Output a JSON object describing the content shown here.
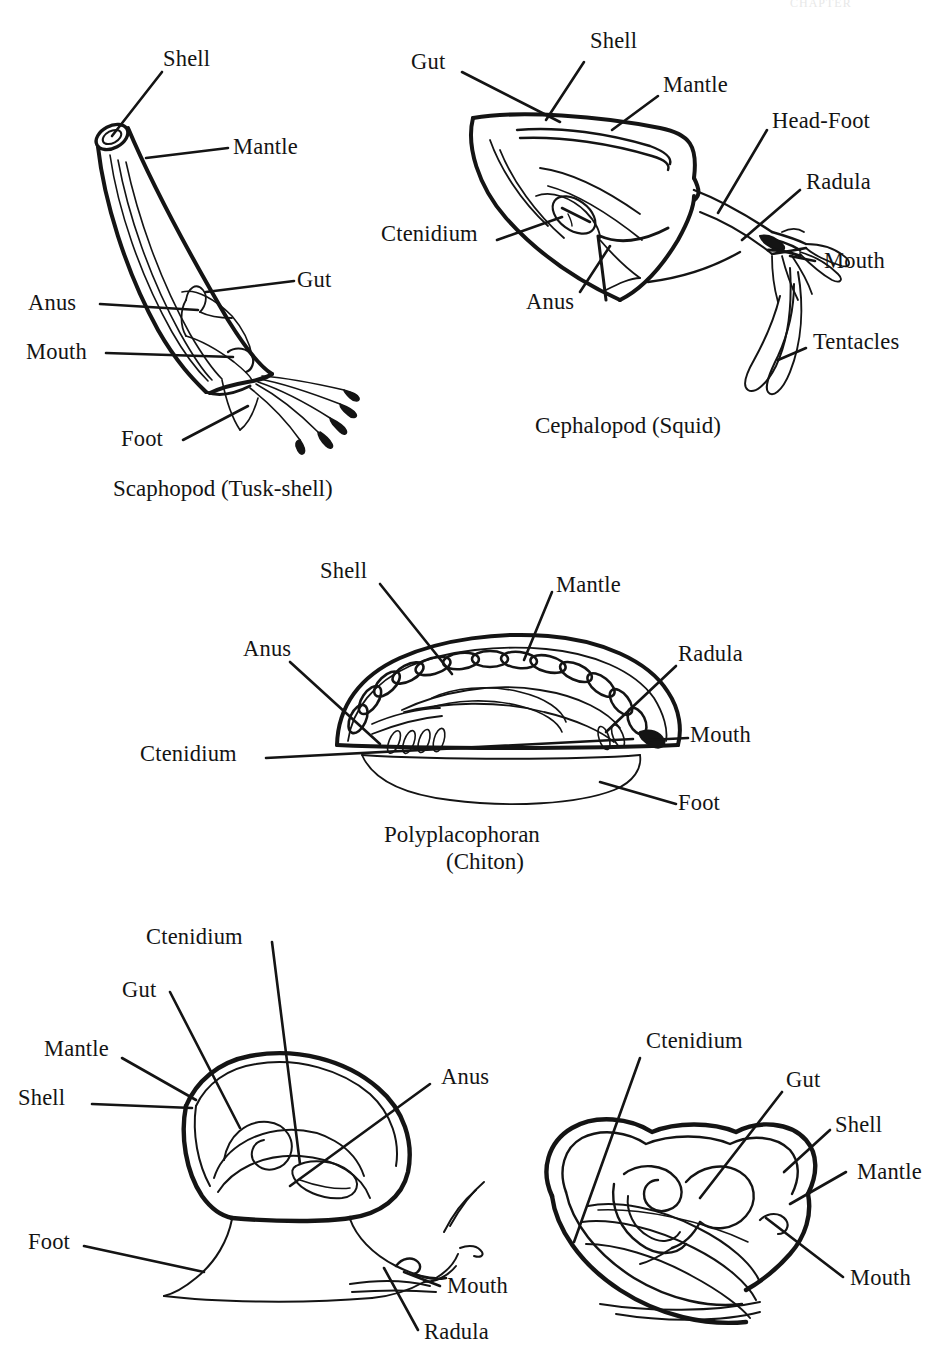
{
  "page": {
    "background_color": "#ffffff",
    "ink_color": "#141414",
    "header_fragment": "CHAPTER"
  },
  "panels": [
    {
      "key": "scaphopod",
      "caption": "Scaphopod (Tusk-shell)",
      "labels": [
        {
          "name": "shell",
          "text": "Shell"
        },
        {
          "name": "mantle",
          "text": "Mantle"
        },
        {
          "name": "gut",
          "text": "Gut"
        },
        {
          "name": "anus",
          "text": "Anus"
        },
        {
          "name": "mouth",
          "text": "Mouth"
        },
        {
          "name": "foot",
          "text": "Foot"
        }
      ]
    },
    {
      "key": "cephalopod",
      "caption": "Cephalopod (Squid)",
      "labels": [
        {
          "name": "gut",
          "text": "Gut"
        },
        {
          "name": "shell",
          "text": "Shell"
        },
        {
          "name": "mantle",
          "text": "Mantle"
        },
        {
          "name": "head-foot",
          "text": "Head-Foot"
        },
        {
          "name": "radula",
          "text": "Radula"
        },
        {
          "name": "mouth",
          "text": "Mouth"
        },
        {
          "name": "tentacles",
          "text": "Tentacles"
        },
        {
          "name": "ctenidium",
          "text": "Ctenidium"
        },
        {
          "name": "anus",
          "text": "Anus"
        }
      ]
    },
    {
      "key": "polyplacophoran",
      "caption_line1": "Polyplacophoran",
      "caption_line2": "(Chiton)",
      "labels": [
        {
          "name": "shell",
          "text": "Shell"
        },
        {
          "name": "mantle",
          "text": "Mantle"
        },
        {
          "name": "anus",
          "text": "Anus"
        },
        {
          "name": "radula",
          "text": "Radula"
        },
        {
          "name": "ctenidium",
          "text": "Ctenidium"
        },
        {
          "name": "mouth",
          "text": "Mouth"
        },
        {
          "name": "foot",
          "text": "Foot"
        }
      ]
    },
    {
      "key": "gastropod",
      "caption": "",
      "labels": [
        {
          "name": "ctenidium",
          "text": "Ctenidium"
        },
        {
          "name": "gut",
          "text": "Gut"
        },
        {
          "name": "mantle",
          "text": "Mantle"
        },
        {
          "name": "shell",
          "text": "Shell"
        },
        {
          "name": "anus",
          "text": "Anus"
        },
        {
          "name": "foot",
          "text": "Foot"
        },
        {
          "name": "mouth",
          "text": "Mouth"
        },
        {
          "name": "radula",
          "text": "Radula"
        }
      ]
    },
    {
      "key": "bivalve",
      "caption": "",
      "labels": [
        {
          "name": "ctenidium",
          "text": "Ctenidium"
        },
        {
          "name": "gut",
          "text": "Gut"
        },
        {
          "name": "shell",
          "text": "Shell"
        },
        {
          "name": "mantle",
          "text": "Mantle"
        },
        {
          "name": "mouth",
          "text": "Mouth"
        }
      ]
    }
  ]
}
